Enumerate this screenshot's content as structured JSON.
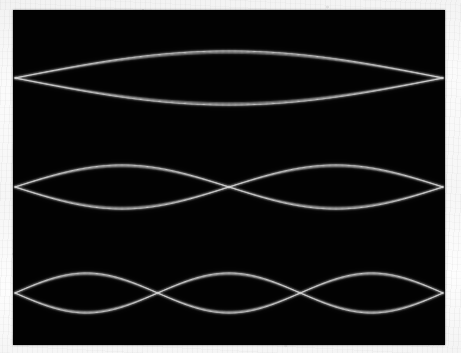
{
  "image": {
    "kind": "photograph",
    "subject": "standing-waves-on-a-vibrating-string",
    "width": 461,
    "height": 353,
    "border_color": "#f7f7f7",
    "plate_color": "#020202",
    "wave_color": "#dcdcdc"
  },
  "plate": {
    "x": 13,
    "y": 10,
    "width": 432,
    "height": 335
  },
  "chart_data": {
    "type": "line",
    "title": "",
    "subtitle": "",
    "xlabel": "",
    "ylabel": "",
    "grid": false,
    "legend": "none",
    "background": "#020202",
    "stroke_color": "#dcdcdc",
    "xlim": [
      0,
      432
    ],
    "ylim": [
      0,
      335
    ],
    "description": "Three time-exposure photographs of a vibrating string showing the first three standing-wave modes, each traced as a pair of mirrored sinusoidal envelopes.",
    "series": [
      {
        "name": "mode-1-fundamental",
        "harmonic": 1,
        "antinodes": 1,
        "node_count": 2,
        "node_x": [
          2,
          430
        ],
        "axis_y": 68,
        "amplitude": 27,
        "half_wavelength": 428,
        "envelope": "upper-and-lower"
      },
      {
        "name": "mode-2-first-overtone",
        "harmonic": 2,
        "antinodes": 2,
        "node_count": 3,
        "node_x": [
          2,
          214,
          430
        ],
        "axis_y": 177,
        "amplitude": 22,
        "half_wavelength": 214,
        "envelope": "upper-and-lower"
      },
      {
        "name": "mode-3-second-overtone",
        "harmonic": 3,
        "antinodes": 3,
        "node_count": 4,
        "node_x": [
          2,
          145,
          287,
          430
        ],
        "axis_y": 283,
        "amplitude": 20,
        "half_wavelength": 142.7,
        "envelope": "upper-and-lower"
      }
    ]
  }
}
